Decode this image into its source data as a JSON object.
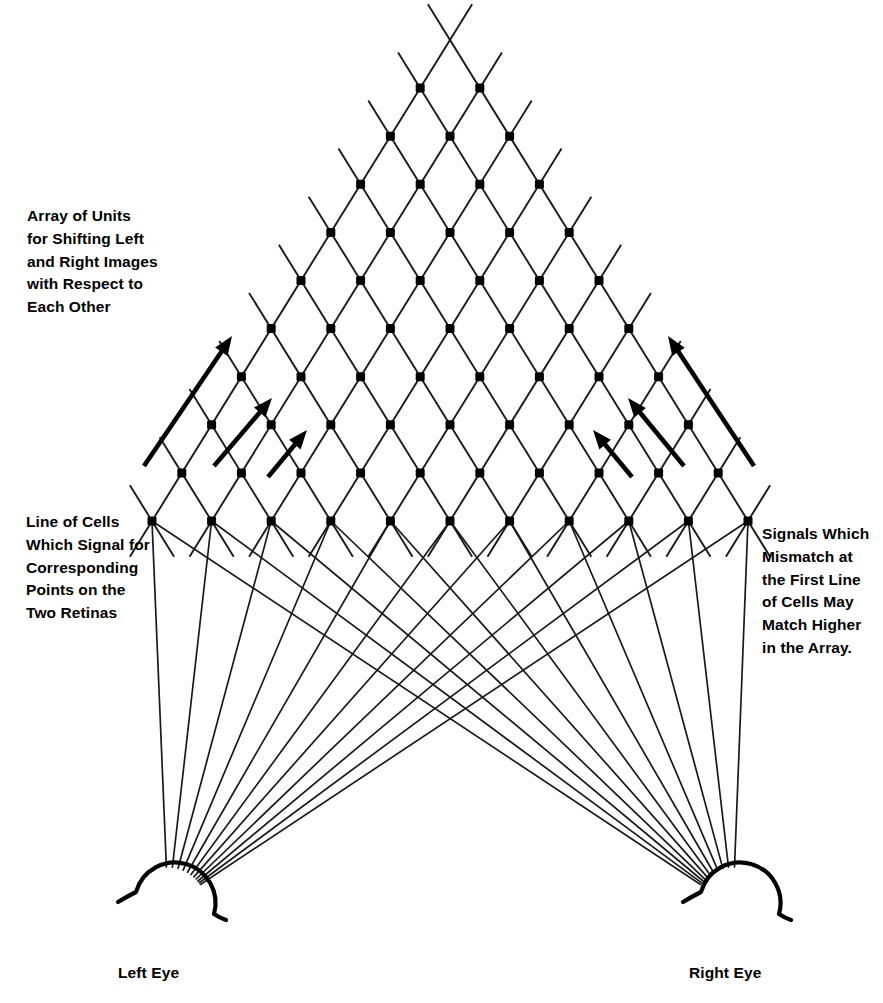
{
  "figure": {
    "type": "diagram",
    "background_color": "#ffffff",
    "line_color": "#1a1a1a",
    "node_color": "#000000",
    "labels": {
      "array_of_units": "Array of Units\nfor Shifting Left\nand Right Images\nwith Respect to\nEach Other",
      "line_of_cells": "Line of Cells\nWhich Signal for\nCorresponding\nPoints on the\nTwo Retinas",
      "mismatch_note": "Signals Which\nMismatch at\nthe First Line\nof Cells May\nMatch Higher\nin the Array.",
      "left_eye": "Left Eye",
      "right_eye": "Right Eye"
    },
    "lattice": {
      "description": "Triangular diamond lattice of square cell nodes",
      "apex_x": 450,
      "apex_y": 78,
      "bottom_row_y": 521,
      "row_spacing": 48.1,
      "column_half_spacing": 29.8,
      "bottom_row_node_count": 11,
      "row_count": 10,
      "node_size": 9,
      "leftmost_bottom_node_x": 152,
      "rightmost_bottom_node_x": 748,
      "line_overshoot": 42
    },
    "eyes": [
      {
        "name": "left-eye",
        "cx": 168,
        "cy": 906,
        "r": 40
      },
      {
        "name": "right-eye",
        "cx": 733,
        "cy": 906,
        "r": 40
      }
    ],
    "shift_arrows": {
      "left_side": [
        {
          "x1": 144,
          "y1": 466,
          "x2": 232,
          "y2": 336
        },
        {
          "x1": 214,
          "y1": 466,
          "x2": 272,
          "y2": 398
        },
        {
          "x1": 268,
          "y1": 477,
          "x2": 307,
          "y2": 430
        }
      ],
      "right_side": [
        {
          "x1": 754,
          "y1": 466,
          "x2": 668,
          "y2": 336
        },
        {
          "x1": 684,
          "y1": 466,
          "x2": 628,
          "y2": 398
        },
        {
          "x1": 632,
          "y1": 477,
          "x2": 593,
          "y2": 430
        }
      ]
    }
  }
}
